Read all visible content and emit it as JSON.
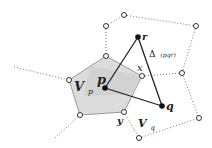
{
  "diagram": {
    "type": "voronoi-delaunay-illustration",
    "labels": {
      "r": "r",
      "p": "p",
      "q": "q",
      "x": "x",
      "y": "y",
      "Vp_main": "V",
      "Vp_sub": "p",
      "Vq_main": "V",
      "Vq_sub": "q",
      "triangle": "Δ",
      "triangle_args": "(pqr)"
    },
    "points": {
      "r": [
        138,
        37
      ],
      "p": [
        105,
        88
      ],
      "q": [
        162,
        106
      ]
    },
    "voronoi_vertices": [
      [
        124,
        15
      ],
      [
        106,
        26
      ],
      [
        196,
        26
      ],
      [
        106,
        56
      ],
      [
        142,
        76
      ],
      [
        182,
        73
      ],
      [
        69,
        80
      ],
      [
        124,
        112
      ],
      [
        80,
        115
      ],
      [
        199,
        118
      ],
      [
        139,
        138
      ]
    ],
    "cell_Vp": [
      [
        106,
        56
      ],
      [
        142,
        76
      ],
      [
        124,
        112
      ],
      [
        80,
        115
      ],
      [
        69,
        80
      ]
    ],
    "colors": {
      "cell_fill": "#d9d9d9",
      "cell_shade": "#c8c8c8",
      "cell_stroke": "#9a9a9a",
      "edges": "#222222",
      "dotted": "#777777"
    }
  }
}
